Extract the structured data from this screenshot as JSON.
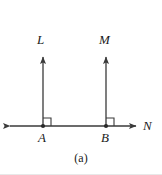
{
  "figure": {
    "caption": "(a)",
    "background_color": "#ffffff",
    "stroke_color": "#3a3a3a",
    "label_color": "#1a1a1a",
    "width": 162,
    "height": 175,
    "labels": {
      "ray_left_vertical": "L",
      "ray_right_vertical": "M",
      "line_horizontal": "N",
      "point_left": "A",
      "point_right": "B"
    },
    "geometry": {
      "description": "Two vertical rays L and M rising perpendicular from points A and B on horizontal line N",
      "horizontal_line": {
        "name": "N",
        "y": 126,
        "x_start": 8,
        "x_end": 138,
        "arrow_start": true,
        "arrow_end": true
      },
      "vertical_rays": [
        {
          "name": "L",
          "x": 43,
          "y_base": 126,
          "y_tip": 50,
          "arrow_tip": true,
          "foot_point": "A"
        },
        {
          "name": "M",
          "x": 106,
          "y_base": 126,
          "y_tip": 50,
          "arrow_tip": true,
          "foot_point": "B"
        }
      ],
      "points": [
        {
          "name": "A",
          "x": 43,
          "y": 126
        },
        {
          "name": "B",
          "x": 106,
          "y": 126
        }
      ],
      "right_angle_marks": [
        {
          "at_point": "A",
          "x": 43,
          "y": 126,
          "size": 8,
          "quadrant": "upper-right"
        },
        {
          "at_point": "B",
          "x": 106,
          "y": 126,
          "size": 8,
          "quadrant": "upper-right"
        }
      ]
    }
  }
}
